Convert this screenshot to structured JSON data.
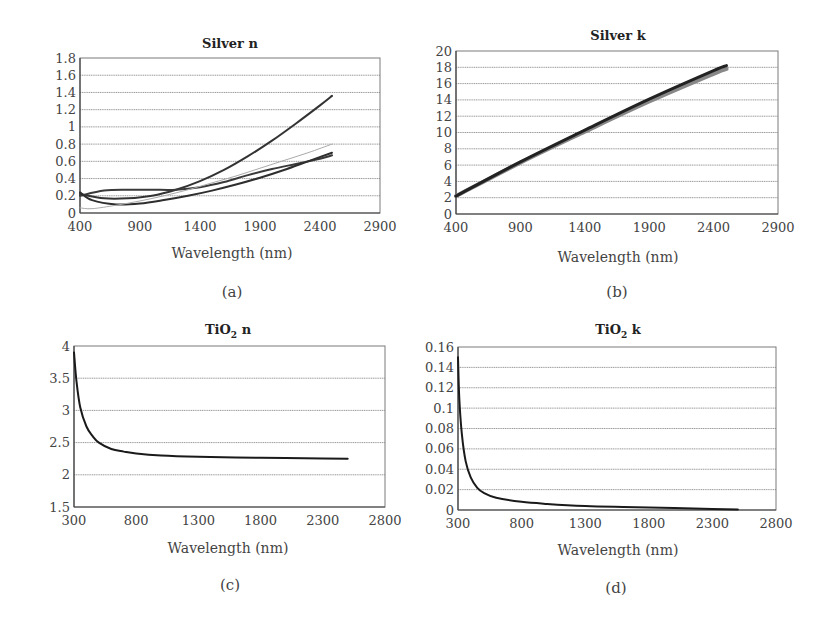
{
  "chart_data": [
    {
      "id": "a",
      "type": "line",
      "title": "Silver n",
      "title_html": "Silver n",
      "xlabel": "Wavelength (nm)",
      "ylabel": "",
      "caption": "(a)",
      "xlim": [
        400,
        2900
      ],
      "ylim": [
        0,
        1.8
      ],
      "xticks": [
        400,
        900,
        1400,
        1900,
        2400,
        2900
      ],
      "yticks": [
        0,
        0.2,
        0.4,
        0.6,
        0.8,
        1,
        1.2,
        1.4,
        1.6,
        1.8
      ],
      "ytick_labels": [
        "0",
        "0.2",
        "0.4",
        "0.6",
        "0.8",
        "1",
        "1.2",
        "1.4",
        "1.6",
        "1.8"
      ],
      "grid": true,
      "legend": null,
      "plot_box": {
        "x": 80,
        "y": 58,
        "w": 300,
        "h": 155
      },
      "series": [
        {
          "name": "series-1",
          "color": "#333333",
          "width": 2,
          "x": [
            400,
            600,
            800,
            1000,
            1200,
            1400,
            1600,
            1800,
            2000,
            2200,
            2400,
            2500
          ],
          "y": [
            0.22,
            0.17,
            0.17,
            0.2,
            0.27,
            0.37,
            0.5,
            0.66,
            0.84,
            1.04,
            1.25,
            1.36
          ]
        },
        {
          "name": "series-2",
          "color": "#3a3a3a",
          "width": 2,
          "x": [
            400,
            600,
            800,
            1000,
            1200,
            1400,
            1600,
            1800,
            2000,
            2200,
            2400,
            2500
          ],
          "y": [
            0.2,
            0.26,
            0.27,
            0.27,
            0.27,
            0.3,
            0.36,
            0.44,
            0.51,
            0.57,
            0.63,
            0.67
          ]
        },
        {
          "name": "series-3",
          "color": "#2e2e2e",
          "width": 2,
          "x": [
            400,
            500,
            700,
            900,
            1100,
            1300,
            1500,
            1700,
            1900,
            2100,
            2300,
            2500
          ],
          "y": [
            0.24,
            0.15,
            0.1,
            0.11,
            0.15,
            0.2,
            0.26,
            0.33,
            0.41,
            0.5,
            0.6,
            0.7
          ]
        },
        {
          "name": "series-4",
          "color": "#aaaaaa",
          "width": 1,
          "x": [
            400,
            500,
            700,
            900,
            1100,
            1300,
            1500,
            1700,
            1900,
            2100,
            2300,
            2500
          ],
          "y": [
            0.06,
            0.05,
            0.09,
            0.14,
            0.2,
            0.27,
            0.35,
            0.43,
            0.52,
            0.61,
            0.7,
            0.8
          ]
        }
      ]
    },
    {
      "id": "b",
      "type": "line",
      "title": "Silver k",
      "title_html": "Silver k",
      "xlabel": "Wavelength (nm)",
      "ylabel": "",
      "caption": "(b)",
      "xlim": [
        400,
        2900
      ],
      "ylim": [
        0,
        20
      ],
      "xticks": [
        400,
        900,
        1400,
        1900,
        2400,
        2900
      ],
      "yticks": [
        0,
        2,
        4,
        6,
        8,
        10,
        12,
        14,
        16,
        18,
        20
      ],
      "ytick_labels": [
        "0",
        "2",
        "4",
        "6",
        "8",
        "10",
        "12",
        "14",
        "16",
        "18",
        "20"
      ],
      "grid": true,
      "legend": null,
      "plot_box": {
        "x": 456,
        "y": 51,
        "w": 322,
        "h": 163
      },
      "series": [
        {
          "name": "series-1",
          "color": "#888888",
          "width": 4,
          "x": [
            400,
            900,
            1400,
            1900,
            2400,
            2500
          ],
          "y": [
            2.2,
            6.3,
            10.1,
            13.8,
            17.2,
            17.8
          ]
        },
        {
          "name": "series-2",
          "color": "#222222",
          "width": 3,
          "x": [
            400,
            900,
            1400,
            1900,
            2400,
            2500
          ],
          "y": [
            2.2,
            6.4,
            10.3,
            14.1,
            17.6,
            18.2
          ]
        }
      ]
    },
    {
      "id": "c",
      "type": "line",
      "title": "TiO2 n",
      "title_html": "TiO<sub>2</sub> n",
      "xlabel": "Wavelength (nm)",
      "ylabel": "",
      "caption": "(c)",
      "xlim": [
        300,
        2800
      ],
      "ylim": [
        1.5,
        4
      ],
      "xticks": [
        300,
        800,
        1300,
        1800,
        2300,
        2800
      ],
      "yticks": [
        1.5,
        2,
        2.5,
        3,
        3.5,
        4
      ],
      "ytick_labels": [
        "1.5",
        "2",
        "2.5",
        "3",
        "3.5",
        "4"
      ],
      "grid": true,
      "legend": null,
      "plot_box": {
        "x": 74,
        "y": 346,
        "w": 311,
        "h": 161
      },
      "series": [
        {
          "name": "TiO2 n",
          "color": "#1a1a1a",
          "width": 2,
          "x": [
            300,
            320,
            350,
            400,
            450,
            500,
            600,
            700,
            800,
            1000,
            1300,
            1600,
            2000,
            2300,
            2500
          ],
          "y": [
            3.9,
            3.45,
            3.05,
            2.75,
            2.6,
            2.5,
            2.4,
            2.36,
            2.33,
            2.3,
            2.28,
            2.27,
            2.26,
            2.255,
            2.25
          ]
        }
      ]
    },
    {
      "id": "d",
      "type": "line",
      "title": "TiO2 k",
      "title_html": "TiO<sub>2</sub> k",
      "xlabel": "Wavelength (nm)",
      "ylabel": "",
      "caption": "(d)",
      "xlim": [
        300,
        2800
      ],
      "ylim": [
        0,
        0.16
      ],
      "xticks": [
        300,
        800,
        1300,
        1800,
        2300,
        2800
      ],
      "yticks": [
        0,
        0.02,
        0.04,
        0.06,
        0.08,
        0.1,
        0.12,
        0.14,
        0.16
      ],
      "ytick_labels": [
        "0",
        "0.02",
        "0.04",
        "0.06",
        "0.08",
        "0.1",
        "0.12",
        "0.14",
        "0.16"
      ],
      "grid": true,
      "legend": null,
      "plot_box": {
        "x": 458,
        "y": 347,
        "w": 318,
        "h": 163
      },
      "series": [
        {
          "name": "TiO2 k",
          "color": "#1a1a1a",
          "width": 2,
          "x": [
            300,
            310,
            330,
            360,
            400,
            450,
            500,
            600,
            800,
            1000,
            1300,
            1600,
            2000,
            2300,
            2500
          ],
          "y": [
            0.15,
            0.11,
            0.075,
            0.048,
            0.032,
            0.022,
            0.017,
            0.012,
            0.008,
            0.006,
            0.004,
            0.003,
            0.002,
            0.001,
            0.0005
          ]
        }
      ]
    }
  ]
}
